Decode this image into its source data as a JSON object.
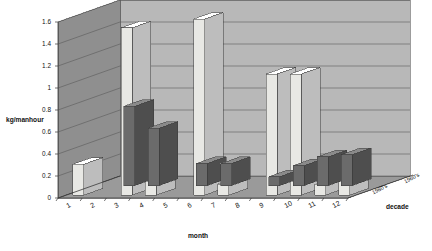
{
  "chart_data": {
    "type": "bar",
    "title": "Fishing returns by decade",
    "xlabel": "month",
    "ylabel": "kg/manhour",
    "zlabel": "decade",
    "categories": [
      "1",
      "2",
      "3",
      "4",
      "5",
      "6",
      "7",
      "8",
      "9",
      "10",
      "11",
      "12"
    ],
    "ylim": [
      0,
      1.6
    ],
    "yticks": [
      "0",
      "0.2",
      "0.4",
      "0.6",
      "0.8",
      "1",
      "1.2",
      "1.4",
      "1.6"
    ],
    "ytick_values": [
      0,
      0.2,
      0.4,
      0.6,
      0.8,
      1.0,
      1.2,
      1.4,
      1.6
    ],
    "grid": true,
    "legend_position": "depth-axis",
    "projection": "3d-column",
    "series": [
      {
        "name": "1960's",
        "color": "#6b6b6b",
        "values": [
          0,
          0.72,
          0.52,
          0,
          0.2,
          0.2,
          0,
          0.08,
          0.18,
          0.26,
          0.28,
          0
        ]
      },
      {
        "name": "1980's",
        "color": "#e8e8e4",
        "values": [
          0.28,
          0,
          1.52,
          0.22,
          0,
          1.6,
          0.1,
          0,
          1.1,
          1.1,
          0.1,
          0.2
        ]
      }
    ]
  },
  "style": {
    "back_wall": "#b8b8b8",
    "side_wall": "#8f8f8f",
    "floor": "#9a9a9a",
    "grid_line": "#5a5a5a",
    "axis_line": "#3a3a3a",
    "bar_dark_top": "#8a8a8a",
    "bar_dark_side": "#4e4e4e",
    "bar_light_top": "#ffffff",
    "bar_light_side": "#bdbdbd",
    "text": "#111111"
  }
}
